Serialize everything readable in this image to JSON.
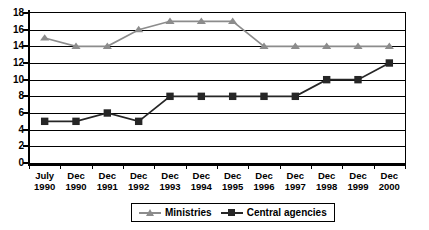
{
  "chart_data": {
    "type": "line",
    "title": "",
    "subtitle": "",
    "xlabel": "",
    "ylabel": "",
    "ylim": [
      0,
      18
    ],
    "ytick_step": 2,
    "yticks": [
      0,
      2,
      4,
      6,
      8,
      10,
      12,
      14,
      16,
      18
    ],
    "grid": true,
    "grid_axis": "y",
    "legend_position": "bottom-center",
    "categories": [
      "July 1990",
      "Dec 1990",
      "Dec 1991",
      "Dec 1992",
      "Dec 1993",
      "Dec 1994",
      "Dec 1995",
      "Dec 1996",
      "Dec 1997",
      "Dec 1998",
      "Dec 1999",
      "Dec 2000"
    ],
    "category_lines": [
      [
        "July",
        "1990"
      ],
      [
        "Dec",
        "1990"
      ],
      [
        "Dec",
        "1991"
      ],
      [
        "Dec",
        "1992"
      ],
      [
        "Dec",
        "1993"
      ],
      [
        "Dec",
        "1994"
      ],
      [
        "Dec",
        "1995"
      ],
      [
        "Dec",
        "1996"
      ],
      [
        "Dec",
        "1997"
      ],
      [
        "Dec",
        "1998"
      ],
      [
        "Dec",
        "1999"
      ],
      [
        "Dec",
        "2000"
      ]
    ],
    "series": [
      {
        "name": "Ministries",
        "marker": "triangle",
        "color": "#8c8c8c",
        "values": [
          15,
          14,
          14,
          16,
          17,
          17,
          17,
          14,
          14,
          14,
          14,
          14
        ]
      },
      {
        "name": "Central agencies",
        "marker": "square",
        "color": "#262626",
        "values": [
          5,
          5,
          6,
          5,
          8,
          8,
          8,
          8,
          8,
          10,
          10,
          12
        ]
      }
    ]
  },
  "legend": {
    "items": [
      {
        "label": "Ministries",
        "marker": "triangle-marker",
        "color": "#8c8c8c"
      },
      {
        "label": "Central agencies",
        "marker": "square-marker",
        "color": "#262626"
      }
    ]
  },
  "axes": {
    "y_tick_labels": [
      "18",
      "16",
      "14",
      "12",
      "10",
      "8",
      "6",
      "4",
      "2",
      "0"
    ]
  }
}
